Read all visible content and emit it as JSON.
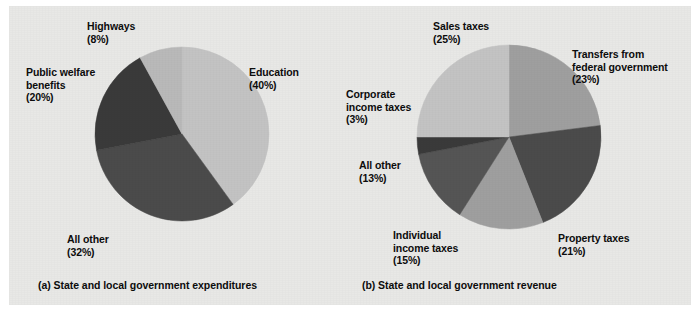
{
  "figure": {
    "background_color": "#e8e8e6",
    "text_color": "#0d0d0d"
  },
  "panels": [
    {
      "id": "a",
      "caption": "(a) State and local government expenditures"
    },
    {
      "id": "b",
      "caption": "(b) State and local government revenue"
    }
  ],
  "chart_data": [
    {
      "type": "pie",
      "title": "(a) State and local government expenditures",
      "start_angle_deg": 0,
      "direction": "clockwise",
      "labels": [
        "Education",
        "All other",
        "Public welfare benefits",
        "Highways"
      ],
      "values": [
        40,
        32,
        20,
        8
      ],
      "unit": "percent",
      "colors": [
        "#c3c3c3",
        "#4b4b4b",
        "#3a3a3a",
        "#b9b9b9"
      ],
      "slices": [
        {
          "name": "Education",
          "label_line1": "Education",
          "label_line2": "(40%)",
          "value": 40,
          "color": "#c3c3c3"
        },
        {
          "name": "All other",
          "label_line1": "All other",
          "label_line2": "(32%)",
          "value": 32,
          "color": "#4b4b4b"
        },
        {
          "name": "Public welfare benefits",
          "label_line1": "Public welfare",
          "label_line2": "benefits",
          "label_line3": "(20%)",
          "value": 20,
          "color": "#3a3a3a"
        },
        {
          "name": "Highways",
          "label_line1": "Highways",
          "label_line2": "(8%)",
          "value": 8,
          "color": "#b9b9b9"
        }
      ]
    },
    {
      "type": "pie",
      "title": "(b) State and local government revenue",
      "start_angle_deg": 0,
      "direction": "clockwise",
      "labels": [
        "Transfers from federal government",
        "Property taxes",
        "Individual income taxes",
        "All other",
        "Corporate income taxes",
        "Sales taxes"
      ],
      "values": [
        23,
        21,
        15,
        13,
        3,
        25
      ],
      "unit": "percent",
      "colors": [
        "#9f9f9f",
        "#4b4b4b",
        "#9f9f9f",
        "#555555",
        "#3a3a3a",
        "#c3c3c3"
      ],
      "slices": [
        {
          "name": "Transfers from federal government",
          "label_line1": "Transfers from",
          "label_line2": "federal government",
          "label_line3": "(23%)",
          "value": 23,
          "color": "#9f9f9f"
        },
        {
          "name": "Property taxes",
          "label_line1": "Property taxes",
          "label_line2": "(21%)",
          "value": 21,
          "color": "#4b4b4b"
        },
        {
          "name": "Individual income taxes",
          "label_line1": "Individual",
          "label_line2": "income taxes",
          "label_line3": "(15%)",
          "value": 15,
          "color": "#9f9f9f"
        },
        {
          "name": "All other",
          "label_line1": "All other",
          "label_line2": "(13%)",
          "value": 13,
          "color": "#555555"
        },
        {
          "name": "Corporate income taxes",
          "label_line1": "Corporate",
          "label_line2": "income taxes",
          "label_line3": "(3%)",
          "value": 3,
          "color": "#3a3a3a"
        },
        {
          "name": "Sales taxes",
          "label_line1": "Sales taxes",
          "label_line2": "(25%)",
          "value": 25,
          "color": "#c3c3c3"
        }
      ]
    }
  ]
}
